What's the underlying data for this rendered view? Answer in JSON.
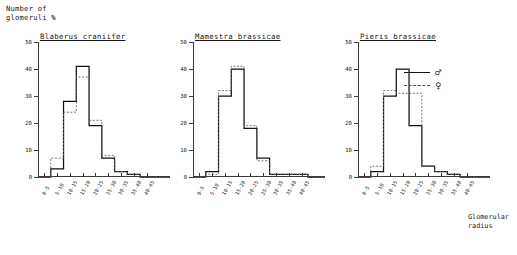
{
  "figure": {
    "y_axis_label": "Number of\nglomeruli %",
    "x_axis_label": "Glomerular\nradius",
    "y_ticks": [
      0,
      10,
      20,
      30,
      40,
      50
    ],
    "ylim": [
      0,
      50
    ]
  },
  "legend": {
    "position": "top-right",
    "entries": [
      {
        "symbol": "♂",
        "style": "solid",
        "name": "male"
      },
      {
        "symbol": "♀",
        "style": "dashed",
        "name": "female"
      }
    ]
  },
  "chart_data": {
    "type": "line",
    "ylabel": "Number of glomeruli %",
    "xlabel": "Glomerular radius",
    "ylim": [
      0,
      50
    ],
    "grid": false,
    "legend": [
      "♂",
      "♀"
    ],
    "categories": [
      "0-5",
      "5-10",
      "10-15",
      "15-20",
      "20-25",
      "25-30",
      "30-35",
      "35-40",
      "40-45"
    ],
    "panels": [
      {
        "title": "Blaberus craniifer",
        "series": [
          {
            "name": "♂",
            "style": "solid",
            "values": [
              0,
              3,
              28,
              41,
              19,
              7,
              2,
              1,
              0
            ]
          },
          {
            "name": "♀",
            "style": "dashed",
            "values": [
              0,
              7,
              24,
              37,
              21,
              8,
              2,
              1,
              0
            ]
          }
        ]
      },
      {
        "title": "Mamestra brassicae",
        "series": [
          {
            "name": "♂",
            "style": "solid",
            "values": [
              0,
              2,
              30,
              40,
              18,
              7,
              1,
              1,
              1
            ]
          },
          {
            "name": "♀",
            "style": "dashed",
            "values": [
              0,
              1,
              32,
              41,
              19,
              6,
              1,
              1,
              1
            ]
          }
        ]
      },
      {
        "title": "Pieris brassicae",
        "series": [
          {
            "name": "♂",
            "style": "solid",
            "values": [
              0,
              2,
              30,
              40,
              19,
              4,
              2,
              1,
              0
            ]
          },
          {
            "name": "♀",
            "style": "dashed",
            "values": [
              0,
              4,
              32,
              31,
              31,
              4,
              2,
              1,
              0
            ]
          }
        ]
      }
    ]
  }
}
